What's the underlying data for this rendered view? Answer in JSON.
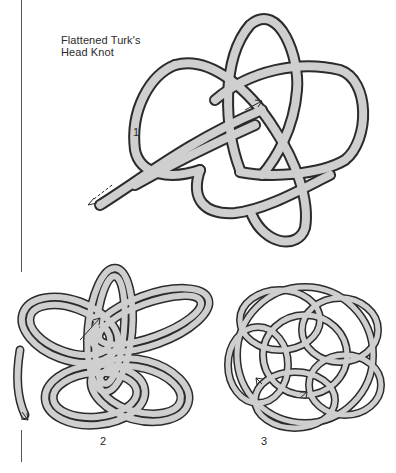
{
  "title": {
    "line1": "Flattened Turk's",
    "line2": "Head Knot"
  },
  "steps": [
    {
      "label": "1",
      "description": "single pass with working end arrows"
    },
    {
      "label": "2",
      "description": "doubled pass"
    },
    {
      "label": "3",
      "description": "completed tripled knot"
    }
  ],
  "colors": {
    "rope_fill": "#cfcfcf",
    "rope_outline": "#2b2b2b",
    "background": "#ffffff"
  }
}
